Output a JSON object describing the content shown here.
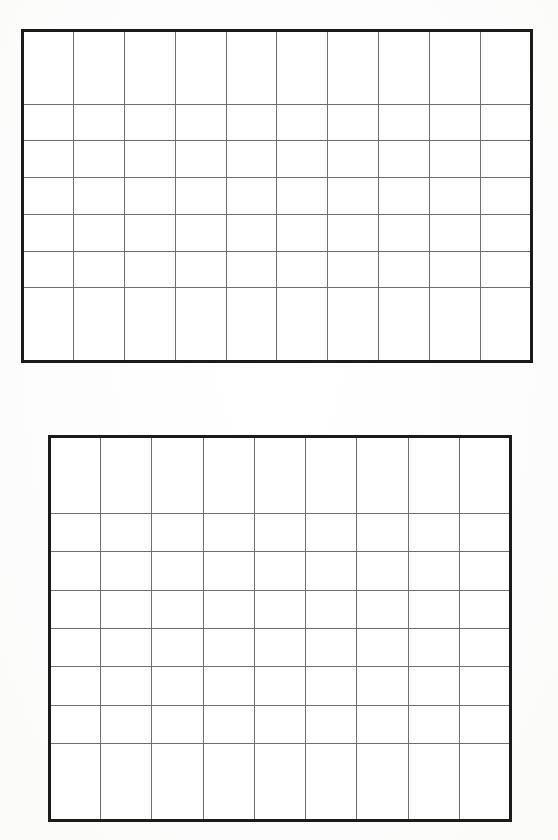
{
  "document": {
    "title": "Blank Grid Worksheet",
    "background_color": "#ffffff",
    "page_width": 558,
    "page_height": 840,
    "description": "Scanned worksheet page containing two empty ruled rectangular grids, one above the other. No text, labels, numbers or marks appear in any cell."
  },
  "style": {
    "outer_border_color": "#1b1b1b",
    "outer_border_width_px": 3,
    "inner_line_color": "#6e6e6e",
    "inner_line_width_px": 1,
    "cell_fill_color": "#ffffff"
  },
  "grids": [
    {
      "id": "grid-top",
      "name": "top-grid",
      "columns": 10,
      "rows": 7,
      "cell_count": 70,
      "x": 21,
      "y": 29,
      "width": 512,
      "height": 334,
      "approx_cell_width_px": 47,
      "approx_cell_height_px": 47,
      "cells": []
    },
    {
      "id": "grid-bottom",
      "name": "bottom-grid",
      "columns": 9,
      "rows": 8,
      "cell_count": 72,
      "x": 48,
      "y": 435,
      "width": 464,
      "height": 387,
      "approx_cell_width_px": 48,
      "approx_cell_height_px": 48,
      "cells": []
    }
  ]
}
